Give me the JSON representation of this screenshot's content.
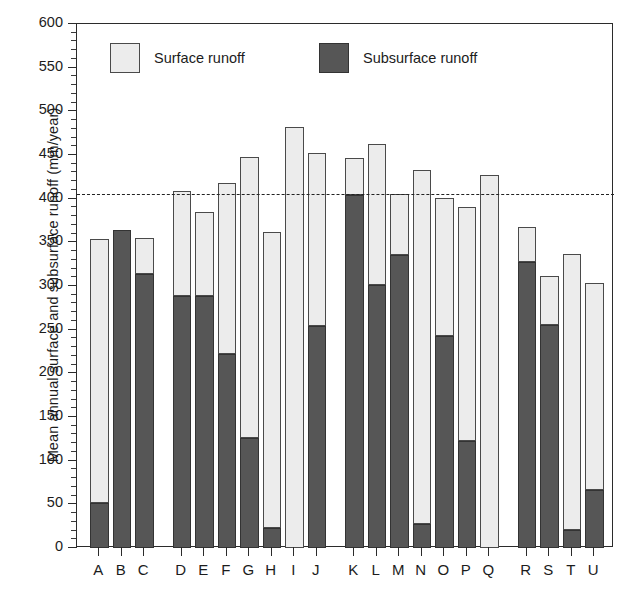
{
  "chart_data": {
    "type": "bar",
    "title": "",
    "subtitle": "",
    "xlabel": "",
    "ylabel": "Mean annual surface and subsurface runoff (mm/year)",
    "ylim": [
      0,
      600
    ],
    "ytick_values": [
      0,
      50,
      100,
      150,
      200,
      250,
      300,
      350,
      400,
      450,
      500,
      550,
      600
    ],
    "ytick_labels": [
      "0",
      "50",
      "100",
      "150",
      "200",
      "250",
      "300",
      "350",
      "400",
      "450",
      "500",
      "550",
      "600"
    ],
    "minor_tick_step": 10,
    "grid": false,
    "stacked": true,
    "legend_position": "inside-top",
    "legend": [
      "Surface runoff",
      "Subsurface runoff"
    ],
    "categories": [
      "A",
      "B",
      "C",
      "D",
      "E",
      "F",
      "G",
      "H",
      "I",
      "J",
      "K",
      "L",
      "M",
      "N",
      "O",
      "P",
      "Q",
      "R",
      "S",
      "T",
      "U"
    ],
    "group_breaks_after": [
      "C",
      "J",
      "Q"
    ],
    "series": [
      {
        "name": "Subsurface runoff",
        "color": "#565656",
        "values": [
          52,
          364,
          314,
          289,
          288,
          222,
          126,
          23,
          0,
          254,
          404,
          301,
          335,
          28,
          243,
          123,
          0,
          327,
          255,
          21,
          66
        ]
      },
      {
        "name": "Surface runoff",
        "color": "#ececec",
        "values": [
          302,
          0,
          41,
          120,
          97,
          196,
          322,
          339,
          482,
          198,
          42,
          162,
          70,
          405,
          158,
          268,
          427,
          41,
          56,
          316,
          238
        ]
      }
    ],
    "totals": [
      354,
      364,
      355,
      409,
      385,
      418,
      448,
      362,
      482,
      452,
      446,
      463,
      405,
      433,
      401,
      391,
      427,
      368,
      311,
      337,
      304
    ],
    "reference_line": {
      "value": 405,
      "style": "dashed",
      "color": "#222222"
    }
  },
  "axes": {
    "y_axis_label": "Mean annual surface and subsurface runoff (mm/year)"
  },
  "legend": {
    "surface_label": "Surface runoff",
    "subsurface_label": "Subsurface runoff"
  },
  "colors": {
    "surface": "#ececec",
    "subsurface": "#565656",
    "axis": "#2b2b2b",
    "reference_line": "#222222",
    "background": "#ffffff"
  }
}
